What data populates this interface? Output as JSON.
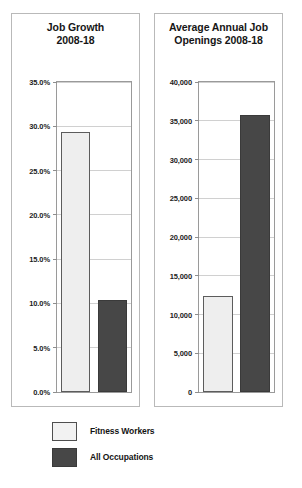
{
  "chart_data": [
    {
      "type": "bar",
      "title": "Job Growth 2008-18",
      "title_lines": [
        "Job Growth",
        "2008-18"
      ],
      "categories": [
        "Fitness Workers",
        "All Occupations"
      ],
      "values": [
        29.4,
        10.4
      ],
      "xlabel": "",
      "ylabel": "",
      "ylim": [
        0,
        35
      ],
      "yticks": [
        0,
        5,
        10,
        15,
        20,
        25,
        30,
        35
      ],
      "ytick_labels": [
        "0.0%",
        "5.0%",
        "10.0%",
        "15.0%",
        "20.0%",
        "25.0%",
        "30.0%",
        "35.0%"
      ],
      "grid": true,
      "legend": "below",
      "series_colors": [
        "#eeeeee",
        "#474747"
      ]
    },
    {
      "type": "bar",
      "title": "Average Annual Job Openings 2008-18",
      "title_lines": [
        "Average Annual Job",
        "Openings 2008-18"
      ],
      "categories": [
        "Fitness Workers",
        "All Occupations"
      ],
      "values": [
        12400,
        35700
      ],
      "xlabel": "",
      "ylabel": "",
      "ylim": [
        0,
        40000
      ],
      "yticks": [
        0,
        5000,
        10000,
        15000,
        20000,
        25000,
        30000,
        35000,
        40000
      ],
      "ytick_labels": [
        "0",
        "5,000",
        "10,000",
        "15,000",
        "20,000",
        "25,000",
        "30,000",
        "35,000",
        "40,000"
      ],
      "grid": true,
      "legend": "below",
      "series_colors": [
        "#eeeeee",
        "#474747"
      ]
    }
  ],
  "legend": {
    "items": [
      {
        "label": "Fitness Workers",
        "color": "#eeeeee",
        "style": "light"
      },
      {
        "label": "All Occupations",
        "color": "#474747",
        "style": "dark"
      }
    ]
  }
}
